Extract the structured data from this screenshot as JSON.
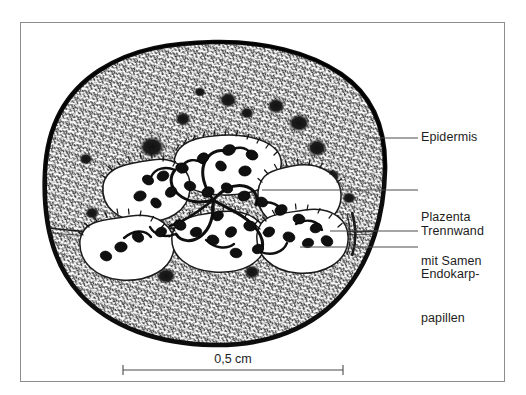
{
  "figure": {
    "kind": "botanical-line-drawing",
    "background_color": "#ffffff",
    "ink_color": "#111111",
    "frame_color": "#8d8d8d"
  },
  "labels": [
    {
      "id": "epidermis",
      "text": "Epidermis"
    },
    {
      "id": "plazenta_line1",
      "text": "Plazenta"
    },
    {
      "id": "plazenta_line2",
      "text": "mit Samen"
    },
    {
      "id": "trennwand",
      "text": "Trennwand"
    },
    {
      "id": "endokarp_line1",
      "text": "Endokarp-"
    },
    {
      "id": "endokarp_line2",
      "text": "papillen"
    }
  ],
  "scale_bar": {
    "text": "0,5 cm",
    "value": 0.5,
    "unit": "cm"
  }
}
